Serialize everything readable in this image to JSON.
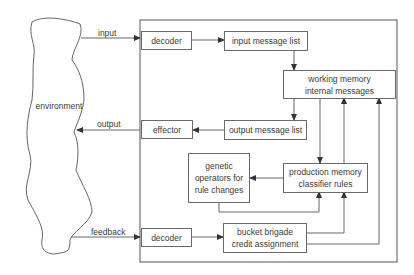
{
  "diagram": {
    "environment": "environment",
    "edges": {
      "input": "input",
      "output": "output",
      "feedback": "feedback"
    },
    "boxes": {
      "decoder_top": {
        "lines": [
          "decoder"
        ]
      },
      "input_message_list": {
        "lines": [
          "input message list"
        ]
      },
      "working_memory": {
        "lines": [
          "working memory",
          "internal messages"
        ]
      },
      "effector": {
        "lines": [
          "effector"
        ]
      },
      "output_message_list": {
        "lines": [
          "output message list"
        ]
      },
      "genetic_operators": {
        "lines": [
          "genetic",
          "operators for",
          "rule changes"
        ]
      },
      "production_memory": {
        "lines": [
          "production memory",
          "classifier rules"
        ]
      },
      "decoder_bottom": {
        "lines": [
          "decoder"
        ]
      },
      "bucket_brigade": {
        "lines": [
          "bucket brigade",
          "credit assignment"
        ]
      }
    },
    "colors": {
      "line": "#555555",
      "text": "#3a3a3a",
      "background": "#ffffff"
    }
  }
}
